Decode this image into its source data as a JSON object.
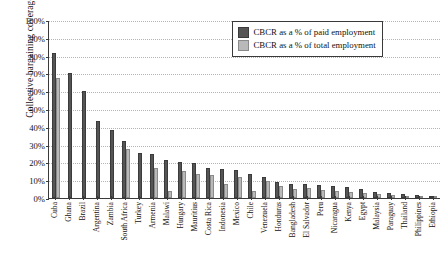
{
  "chart_data": {
    "type": "bar",
    "title": "",
    "xlabel": "",
    "ylabel": "Collective bargaining coverage",
    "ylim": [
      0,
      100
    ],
    "ytick_labels": [
      "0%",
      "10%",
      "20%",
      "30%",
      "40%",
      "50%",
      "60%",
      "70%",
      "80%",
      "90%",
      "100%"
    ],
    "ytick_values": [
      0,
      10,
      20,
      30,
      40,
      50,
      60,
      70,
      80,
      90,
      100
    ],
    "grid": true,
    "legend_position": "top-right",
    "categories": [
      "Cuba",
      "Ghana",
      "Brazil",
      "Argentina",
      "Zambia",
      "South Africa",
      "Turkey",
      "Armenia",
      "Malawi",
      "Hungary",
      "Mauritius",
      "Costa Rica",
      "Indonesia",
      "Mexico",
      "Chile",
      "Venezuela",
      "Honduras",
      "Bangladesh",
      "El Salvador",
      "Peru",
      "Nicaragua",
      "Kenya",
      "Egypt",
      "Malaysia",
      "Paraguay",
      "Thailand",
      "Philippines",
      "Ethiopia"
    ],
    "series": [
      {
        "name": "CBCR as a % of paid employment",
        "color": "#555555",
        "values": [
          81.5,
          70.0,
          60.0,
          43.0,
          38.0,
          32.0,
          25.5,
          25.0,
          21.5,
          20.5,
          19.5,
          17.0,
          16.5,
          15.5,
          13.5,
          12.0,
          9.0,
          8.0,
          8.0,
          7.5,
          6.5,
          6.0,
          5.0,
          3.5,
          3.0,
          2.0,
          1.5,
          1.0
        ]
      },
      {
        "name": "CBCR as a % of total employment",
        "color": "#b9b9b9",
        "values": [
          67.5,
          0,
          0,
          0,
          0,
          27.5,
          0,
          17.0,
          4.0,
          15.0,
          13.5,
          13.0,
          8.0,
          12.0,
          4.0,
          9.5,
          6.5,
          5.0,
          5.5,
          4.5,
          4.0,
          3.5,
          3.0,
          2.0,
          1.5,
          1.0,
          0.8,
          0.5
        ]
      }
    ]
  },
  "legend": {
    "items": [
      {
        "label": "CBCR as a % of paid employment",
        "swatch": "dark"
      },
      {
        "label": "CBCR as a % of total employment",
        "swatch": "light"
      }
    ]
  },
  "axes": {
    "y_title": "Collective bargaining coverage"
  }
}
